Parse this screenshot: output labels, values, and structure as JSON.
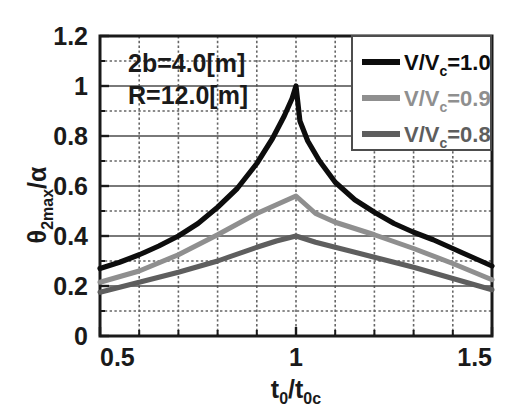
{
  "chart_data": {
    "type": "line",
    "title": "",
    "xlabel": "t0/t0c",
    "ylabel": "theta2max/alpha",
    "xlim": [
      0.5,
      1.5
    ],
    "ylim": [
      0,
      1.2
    ],
    "grid": true,
    "legend_position": "top-right",
    "x_ticks": [
      "0.5",
      "1",
      "1.5"
    ],
    "x_tick_values": [
      0.5,
      1.0,
      1.5
    ],
    "y_ticks": [
      "0",
      "0.2",
      "0.4",
      "0.6",
      "0.8",
      "1",
      "1.2"
    ],
    "y_tick_values": [
      0,
      0.2,
      0.4,
      0.6,
      0.8,
      1.0,
      1.2
    ],
    "x_minor_step": 0.1,
    "y_minor_step": 0.1,
    "annotations": [
      "2b=4.0[m]",
      "R=12.0[m]"
    ],
    "series": [
      {
        "name": "V/Vc=1.0",
        "color": "#0d0d0d",
        "x": [
          0.5,
          0.55,
          0.6,
          0.65,
          0.7,
          0.75,
          0.8,
          0.85,
          0.9,
          0.94,
          0.97,
          0.99,
          1.0,
          1.01,
          1.03,
          1.06,
          1.1,
          1.15,
          1.2,
          1.25,
          1.3,
          1.35,
          1.4,
          1.45,
          1.5
        ],
        "values": [
          0.27,
          0.295,
          0.325,
          0.36,
          0.4,
          0.45,
          0.515,
          0.59,
          0.69,
          0.79,
          0.88,
          0.95,
          1.0,
          0.86,
          0.78,
          0.7,
          0.615,
          0.545,
          0.495,
          0.45,
          0.415,
          0.385,
          0.35,
          0.315,
          0.28
        ]
      },
      {
        "name": "V/Vc=0.9",
        "color": "#8f8f8f",
        "x": [
          0.5,
          0.6,
          0.7,
          0.8,
          0.9,
          0.95,
          1.0,
          1.05,
          1.1,
          1.2,
          1.3,
          1.4,
          1.5
        ],
        "values": [
          0.215,
          0.26,
          0.325,
          0.405,
          0.49,
          0.525,
          0.56,
          0.49,
          0.455,
          0.405,
          0.35,
          0.29,
          0.225
        ]
      },
      {
        "name": "V/Vc=0.8",
        "color": "#5e5e5e",
        "x": [
          0.5,
          0.6,
          0.7,
          0.8,
          0.9,
          0.95,
          1.0,
          1.05,
          1.1,
          1.2,
          1.3,
          1.4,
          1.5
        ],
        "values": [
          0.175,
          0.215,
          0.255,
          0.3,
          0.355,
          0.38,
          0.4,
          0.375,
          0.355,
          0.315,
          0.275,
          0.23,
          0.185
        ]
      }
    ]
  },
  "axes": {
    "y_title_main": "θ",
    "y_title_sub": "2max",
    "y_title_tail": "/α",
    "x_title_main": "t",
    "x_title_sub": "0",
    "x_title_mid": "/t",
    "x_title_sub2": "0c"
  },
  "legend": {
    "entries": [
      {
        "prefix": "V/V",
        "sub": "c",
        "suffix": "=1.0",
        "color": "#0d0d0d"
      },
      {
        "prefix": "V/V",
        "sub": "c",
        "suffix": "=0.9",
        "color": "#8f8f8f"
      },
      {
        "prefix": "V/V",
        "sub": "c",
        "suffix": "=0.8",
        "color": "#5e5e5e"
      }
    ]
  },
  "annotations": {
    "line1": "2b=4.0[m]",
    "line2": "R=12.0[m]"
  },
  "ticklabels": {
    "y": [
      "1.2",
      "1",
      "0.8",
      "0.6",
      "0.4",
      "0.2",
      "0"
    ],
    "x": [
      "0.5",
      "1",
      "1.5"
    ]
  },
  "colors": {
    "axis": "#1a1a1a",
    "grid_major": "#4d4d4d",
    "grid_minor": "#666666",
    "background": "#ffffff"
  }
}
